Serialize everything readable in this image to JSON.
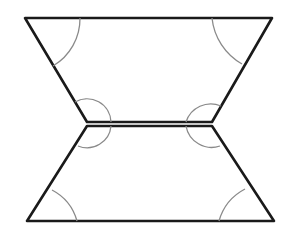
{
  "diagram": {
    "colors": {
      "edge": "#1a1a1a",
      "angle_arc": "#8a8a8a",
      "background": "#ffffff"
    },
    "shapes": [
      {
        "name": "top-trapezoid",
        "vertices": [
          [
            25,
            18
          ],
          [
            272,
            18
          ],
          [
            212,
            122
          ],
          [
            87,
            122
          ]
        ]
      },
      {
        "name": "bottom-trapezoid",
        "vertices": [
          [
            87,
            126
          ],
          [
            212,
            126
          ],
          [
            274,
            221
          ],
          [
            27,
            221
          ]
        ]
      }
    ],
    "angle_marks": 8
  }
}
